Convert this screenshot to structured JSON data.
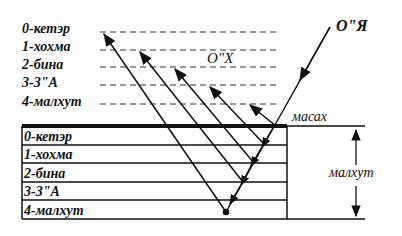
{
  "diagram": {
    "top_levels": [
      "0-кетэр",
      "1-хохма",
      "2-бина",
      "3-З\"А",
      "4-малхут"
    ],
    "table_rows": [
      "0-кетэр",
      "1-хохма",
      "2-бина",
      "3-З\"А",
      "4-малхут"
    ],
    "labels": {
      "incoming": "О\"Я",
      "outgoing": "О\"Х",
      "screen": "масах",
      "depth": "малхут"
    },
    "colors": {
      "ink": "#111111",
      "background": "#ffffff"
    }
  }
}
